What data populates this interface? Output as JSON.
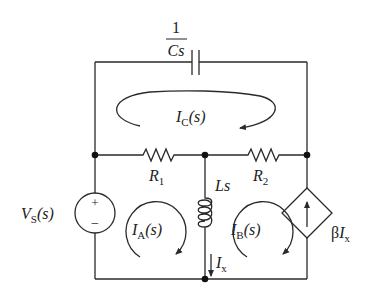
{
  "diagram": {
    "type": "circuit-schematic",
    "domain": "s-domain",
    "components": {
      "capacitor": {
        "label_num": "1",
        "label_den": "Cs"
      },
      "resistor1": {
        "label": "R",
        "sub": "1"
      },
      "resistor2": {
        "label": "R",
        "sub": "2"
      },
      "inductor": {
        "label": "Ls"
      },
      "voltage_source": {
        "label": "V",
        "sub": "S",
        "arg": "(s)",
        "plus": "+",
        "minus": "−"
      },
      "dependent_source": {
        "label_beta": "β",
        "label_I": "I",
        "sub": "x"
      }
    },
    "mesh_currents": [
      {
        "id": "IA",
        "label": "I",
        "sub": "A",
        "arg": "(s)",
        "direction": "clockwise"
      },
      {
        "id": "IB",
        "label": "I",
        "sub": "B",
        "arg": "(s)",
        "direction": "clockwise"
      },
      {
        "id": "IC",
        "label": "I",
        "sub": "C",
        "arg": "(s)",
        "direction": "clockwise"
      }
    ],
    "branch_current": {
      "label": "I",
      "sub": "x",
      "direction": "down"
    }
  }
}
